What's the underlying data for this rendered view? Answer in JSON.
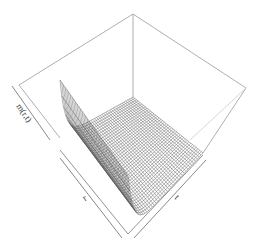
{
  "chart_data": {
    "type": "surface3d",
    "title": "",
    "xlabel": "r",
    "ylabel": "t",
    "zlabel": "m(r,t)",
    "grid": false,
    "box": true,
    "grid_resolution": 40,
    "surface_profile": {
      "along_r": "steep exponential decay from high value at r=min to near zero",
      "along_t": "approximately constant"
    },
    "colors": {
      "wire": "#555555",
      "box": "#888888",
      "background": "#ffffff"
    }
  },
  "labels": {
    "x": "r",
    "y": "t",
    "z": "m(r,t)"
  }
}
